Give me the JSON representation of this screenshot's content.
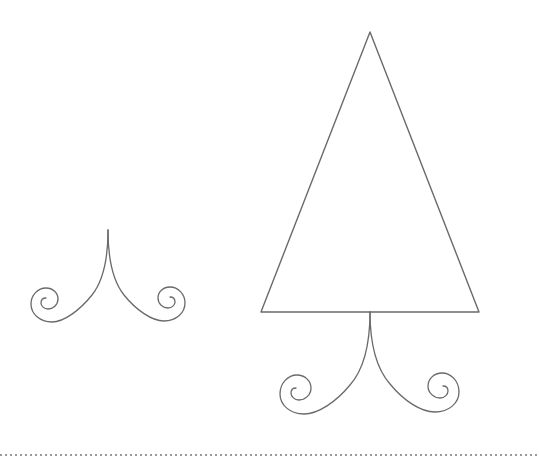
{
  "canvas": {
    "width": 539,
    "height": 460,
    "background_color": "#ffffff",
    "title": "Line drawing of two ornamental flourishes"
  },
  "style": {
    "stroke_color": "#6a6a6a",
    "stroke_width": 1.3,
    "triangle_stroke_width": 1.4,
    "dotted_rule_color": "#9a9a9a",
    "dotted_rule_dot_size": 2,
    "dotted_rule_gap": 3
  },
  "shapes": {
    "small_flourish": {
      "name": "small-flourish-ornament",
      "peak_x": 108,
      "peak_y": 230,
      "left_spiral_center_x": 43,
      "left_spiral_center_y": 311,
      "right_spiral_center_x": 174,
      "right_spiral_center_y": 310,
      "bottom_y": 322,
      "left_arm_path": "M108,230 C108,258 104,280 92,295 C80,310 64,322 52,322 C40,322 31,314 31,304 C31,295 38,288 46,288 C53,288 58,293 58,299 C58,305 53,309 48,309 C44,309 41,306 41,303 C41,300 43,298 46,298",
      "right_arm_path": "M108,230 C108,258 112,280 124,295 C136,310 152,321 164,321 C176,321 185,313 185,303 C185,294 178,287 170,287 C163,287 158,292 158,298 C158,304 163,308 168,308 C172,308 175,305 175,302 C175,299 173,297 170,297"
    },
    "large_tree": {
      "name": "large-tree-ornament",
      "apex_x": 370,
      "apex_y": 32,
      "base_left_x": 261,
      "base_left_y": 312,
      "base_right_x": 479,
      "base_right_y": 312,
      "triangle_path": "M370,32 L479,312 L261,312 Z",
      "trunk_top_x": 370,
      "trunk_top_y": 312,
      "left_spiral_center_x": 305,
      "left_spiral_center_y": 394,
      "right_spiral_center_x": 432,
      "right_spiral_center_y": 392,
      "bottom_y": 413,
      "left_arm_path": "M370,312 C370,340 365,368 350,385 C336,402 318,414 304,414 C290,414 280,405 280,394 C280,383 288,375 297,375 C305,375 311,381 311,388 C311,395 305,400 299,400 C294,400 291,396 291,393 C291,390 293,388 296,388",
      "right_arm_path": "M370,312 C370,340 375,367 390,384 C404,401 421,412 435,412 C449,412 459,403 459,392 C459,381 451,373 442,373 C434,373 428,379 428,386 C428,393 434,398 440,398 C445,398 448,394 448,391 C448,388 446,386 443,386"
    },
    "dotted_rule": {
      "name": "bottom-dotted-rule",
      "y": 455,
      "x_start": 0,
      "x_end": 539
    }
  }
}
